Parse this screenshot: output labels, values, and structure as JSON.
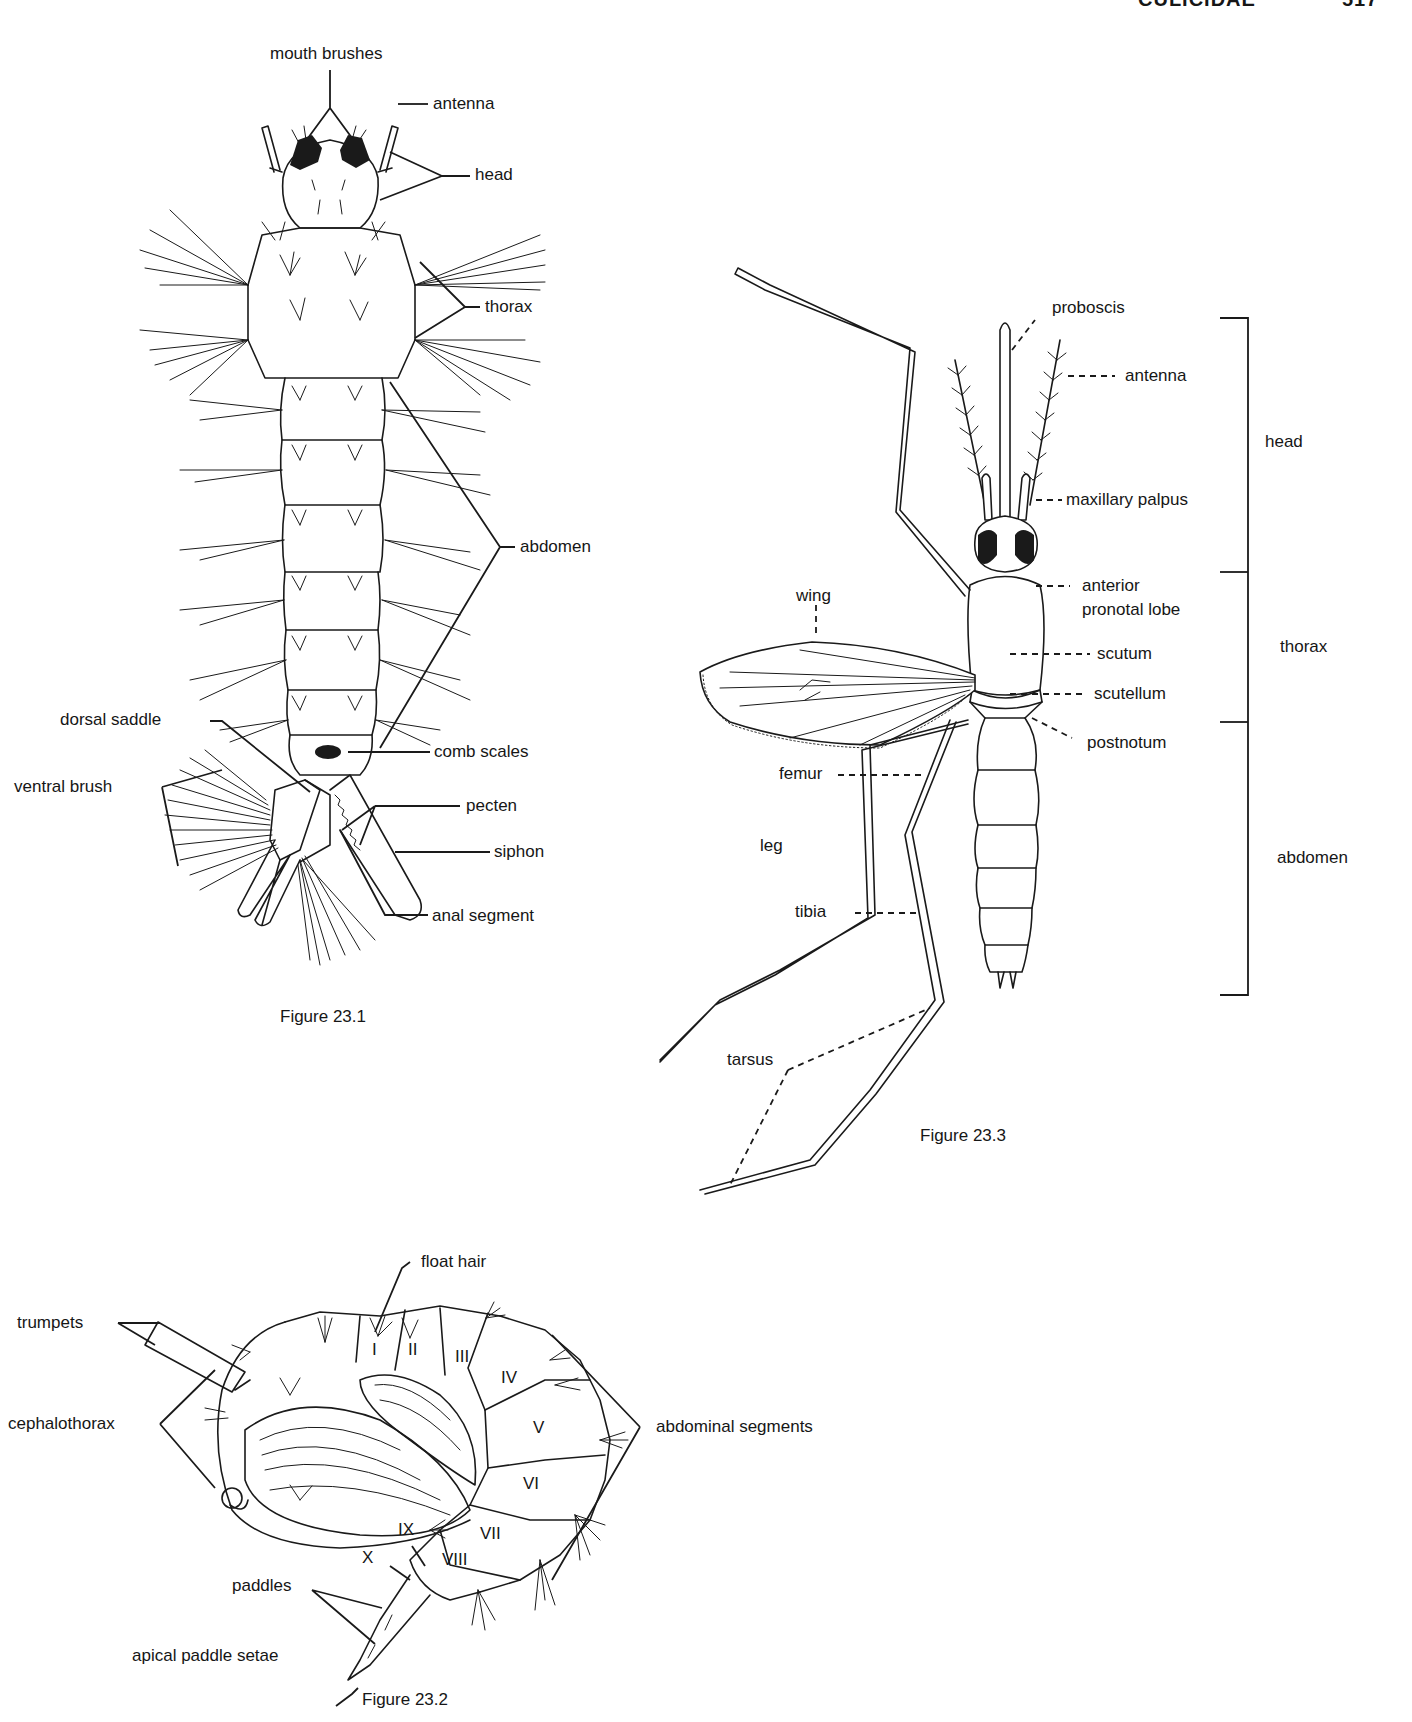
{
  "page": {
    "running_head": "CULICIDAE",
    "page_number": "517"
  },
  "figures": [
    {
      "id": "fig-23-1",
      "caption": "Figure 23.1",
      "subject": "mosquito larva (dorsal view)",
      "labels": {
        "mouth_brushes": "mouth brushes",
        "antenna": "antenna",
        "head": "head",
        "thorax": "thorax",
        "abdomen": "abdomen",
        "dorsal_saddle": "dorsal saddle",
        "comb_scales": "comb scales",
        "ventral_brush": "ventral brush",
        "pecten": "pecten",
        "siphon": "siphon",
        "anal_segment": "anal segment"
      }
    },
    {
      "id": "fig-23-3",
      "caption": "Figure 23.3",
      "subject": "adult mosquito (dorsal view)",
      "labels": {
        "proboscis": "proboscis",
        "antenna": "antenna",
        "maxillary_palpus": "maxillary palpus",
        "anterior_pronotal_lobe_1": "anterior",
        "anterior_pronotal_lobe_2": "pronotal lobe",
        "scutum": "scutum",
        "scutellum": "scutellum",
        "postnotum": "postnotum",
        "wing": "wing",
        "femur": "femur",
        "leg": "leg",
        "tibia": "tibia",
        "tarsus": "tarsus"
      },
      "regions": {
        "head": "head",
        "thorax": "thorax",
        "abdomen": "abdomen"
      }
    },
    {
      "id": "fig-23-2",
      "caption": "Figure 23.2",
      "subject": "mosquito pupa (lateral view)",
      "labels": {
        "float_hair": "float hair",
        "trumpets": "trumpets",
        "cephalothorax": "cephalothorax",
        "abdominal_segments": "abdominal segments",
        "paddles": "paddles",
        "apical_paddle_setae": "apical paddle setae",
        "seg_ix": "IX",
        "seg_x": "X"
      },
      "segments": [
        "I",
        "II",
        "III",
        "IV",
        "V",
        "VI",
        "VII",
        "VIII"
      ]
    }
  ]
}
